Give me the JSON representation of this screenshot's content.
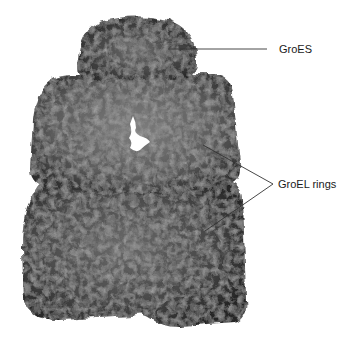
{
  "figure": {
    "labels": {
      "groes": "GroES",
      "groel": "GroEL rings"
    },
    "colors": {
      "background": "#ffffff",
      "protein_dark": "#2a2a2a",
      "protein_mid": "#5a5a5a",
      "protein_light": "#8a8a8a",
      "leader_line": "#333333",
      "text": "#1a1a1a"
    }
  }
}
